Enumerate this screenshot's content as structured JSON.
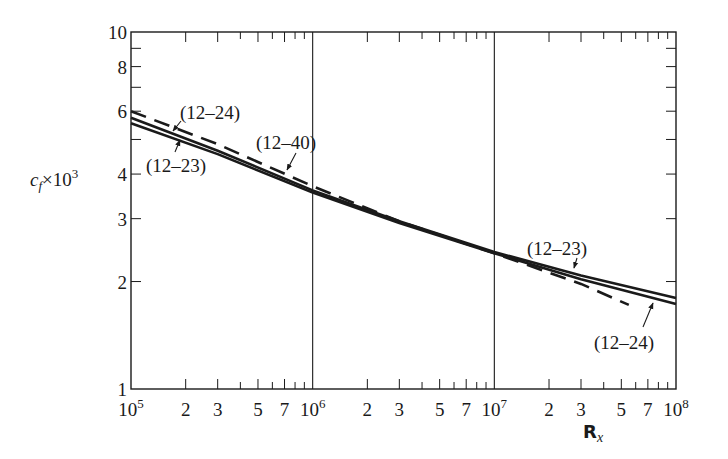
{
  "chart_data": {
    "type": "line",
    "title": "",
    "xlabel": "R_x",
    "xlabel_main": "R",
    "xlabel_sub": "x",
    "ylabel": "c_f × 10^3",
    "ylabel_main": "c",
    "ylabel_sub": "f",
    "ylabel_rest": "×10",
    "ylabel_sup": "3",
    "xscale": "log",
    "yscale": "log",
    "xlim": [
      100000,
      100000000
    ],
    "ylim": [
      1,
      10
    ],
    "grid": "vertical lines at decades",
    "x_ticks": [
      {
        "value": 100000,
        "label": "10",
        "sup": "5"
      },
      {
        "value": 200000,
        "label": "2"
      },
      {
        "value": 300000,
        "label": "3"
      },
      {
        "value": 500000,
        "label": "5"
      },
      {
        "value": 700000,
        "label": "7"
      },
      {
        "value": 1000000,
        "label": "10",
        "sup": "6"
      },
      {
        "value": 2000000,
        "label": "2"
      },
      {
        "value": 3000000,
        "label": "3"
      },
      {
        "value": 5000000,
        "label": "5"
      },
      {
        "value": 7000000,
        "label": "7"
      },
      {
        "value": 10000000,
        "label": "10",
        "sup": "7"
      },
      {
        "value": 20000000,
        "label": "2"
      },
      {
        "value": 30000000,
        "label": "3"
      },
      {
        "value": 50000000,
        "label": "5"
      },
      {
        "value": 70000000,
        "label": "7"
      },
      {
        "value": 100000000,
        "label": "10",
        "sup": "8"
      }
    ],
    "y_ticks": [
      {
        "value": 1,
        "label": "1"
      },
      {
        "value": 2,
        "label": "2"
      },
      {
        "value": 3,
        "label": "3"
      },
      {
        "value": 4,
        "label": "4"
      },
      {
        "value": 6,
        "label": "6"
      },
      {
        "value": 8,
        "label": "8"
      },
      {
        "value": 10,
        "label": "10"
      }
    ],
    "series": [
      {
        "name": "(12-23)",
        "style": "solid",
        "x": [
          100000,
          300000,
          1000000,
          3000000,
          10000000,
          30000000,
          100000000
        ],
        "values": [
          5.75,
          4.65,
          3.6,
          2.95,
          2.42,
          2.08,
          1.8
        ]
      },
      {
        "name": "(12-24)",
        "style": "solid",
        "x": [
          100000,
          300000,
          1000000,
          3000000,
          10000000,
          30000000,
          100000000
        ],
        "values": [
          5.55,
          4.55,
          3.55,
          2.92,
          2.4,
          2.03,
          1.73
        ]
      },
      {
        "name": "(12-40)",
        "style": "dashed",
        "x": [
          100000,
          300000,
          1000000,
          3000000,
          10000000,
          30000000,
          55000000
        ],
        "values": [
          6.0,
          4.85,
          3.7,
          2.95,
          2.4,
          1.97,
          1.72
        ]
      }
    ],
    "annotations": [
      {
        "text": "(12–24)",
        "target_series": "(12-24)",
        "position": "upper-left"
      },
      {
        "text": "(12–23)",
        "target_series": "(12-23)",
        "position": "left"
      },
      {
        "text": "(12–40)",
        "target_series": "(12-40)",
        "position": "upper-left-middle"
      },
      {
        "text": "(12–23)",
        "target_series": "(12-23)",
        "position": "right-above"
      },
      {
        "text": "(12–24)",
        "target_series": "(12-24)",
        "position": "right-below"
      }
    ]
  }
}
